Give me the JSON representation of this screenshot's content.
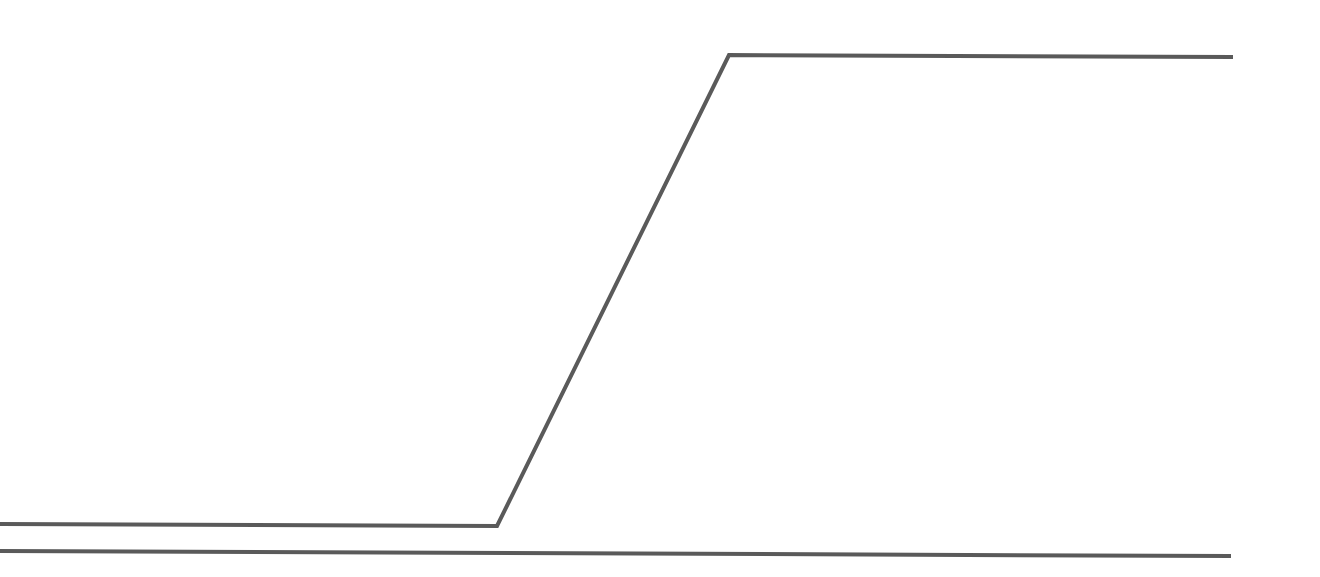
{
  "canvas": {
    "width": 1320,
    "height": 577,
    "background": "#ffffff"
  },
  "style": {
    "stroke_color": "#5a5a5a",
    "stroke_width": 4
  },
  "lines": [
    {
      "id": "ramp-line",
      "description": "step/ramp line: low flat, diagonal rise, high flat",
      "points": "0,524 497,526 729,55 1233,57"
    },
    {
      "id": "baseline",
      "description": "horizontal baseline",
      "points": "0,551 1231,556"
    }
  ]
}
